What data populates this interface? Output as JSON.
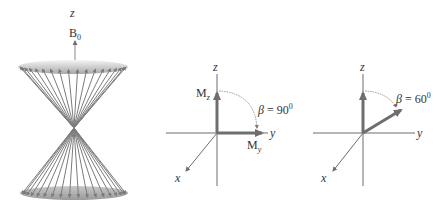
{
  "figure": {
    "colors": {
      "axis": "#6e6e6e",
      "vector": "#7a7a7a",
      "cone": "#8a8a8a",
      "text": "#333333"
    },
    "cone_panel": {
      "z_label": "z",
      "field_label": "B",
      "field_subscript": "0"
    },
    "panel_90": {
      "z_label": "z",
      "y_label": "y",
      "x_label": "x",
      "mz_label": "M",
      "mz_subscript": "z",
      "my_label": "M",
      "my_subscript": "y",
      "beta_symbol": "β",
      "beta_eq": " = 90",
      "beta_degree": "0"
    },
    "panel_60": {
      "z_label": "z",
      "y_label": "y",
      "x_label": "x",
      "beta_symbol": "β",
      "beta_eq": " = 60",
      "beta_degree": "0"
    }
  }
}
